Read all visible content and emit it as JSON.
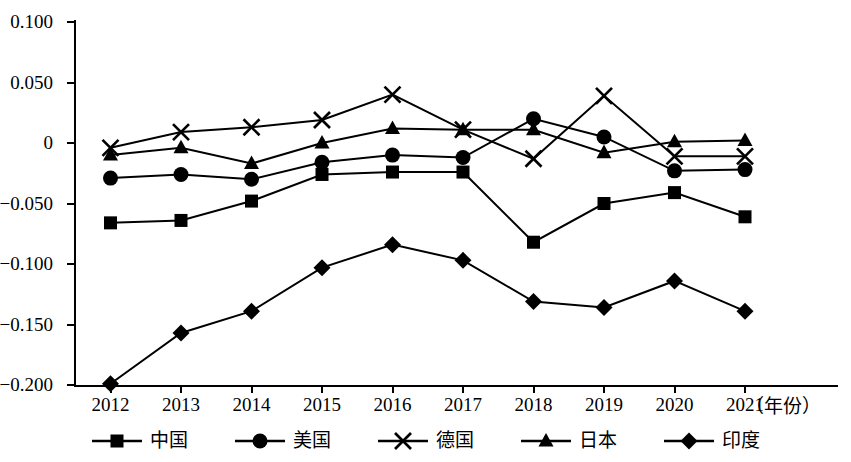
{
  "chart_data": {
    "type": "line",
    "title": "",
    "subtitle": "",
    "xlabel": "（年份）",
    "ylabel": "",
    "x": [
      2012,
      2013,
      2014,
      2015,
      2016,
      2017,
      2018,
      2019,
      2020,
      2021
    ],
    "categories": [
      "2012",
      "2013",
      "2014",
      "2015",
      "2016",
      "2017",
      "2018",
      "2019",
      "2020",
      "2021"
    ],
    "xlim": [
      2011.5,
      2021.6
    ],
    "ylim": [
      -0.2,
      0.1
    ],
    "yticks": [
      0.1,
      0.05,
      0,
      -0.05,
      -0.1,
      -0.15,
      -0.2
    ],
    "ytick_labels": [
      "0.100",
      "0.050",
      "0",
      "−0.050",
      "−0.100",
      "−0.150",
      "−0.200"
    ],
    "grid": false,
    "legend_position": "bottom",
    "series": [
      {
        "name": "中国",
        "marker": "square",
        "color": "#000000",
        "values": [
          -0.066,
          -0.064,
          -0.048,
          -0.026,
          -0.024,
          -0.024,
          -0.082,
          -0.05,
          -0.041,
          -0.061
        ]
      },
      {
        "name": "美国",
        "marker": "circle",
        "color": "#000000",
        "values": [
          -0.029,
          -0.026,
          -0.03,
          -0.016,
          -0.01,
          -0.012,
          0.02,
          0.005,
          -0.023,
          -0.022
        ]
      },
      {
        "name": "德国",
        "marker": "cross",
        "color": "#000000",
        "values": [
          -0.004,
          0.009,
          0.013,
          0.019,
          0.04,
          0.011,
          -0.013,
          0.039,
          -0.011,
          -0.011
        ]
      },
      {
        "name": "日本",
        "marker": "triangle",
        "color": "#000000",
        "values": [
          -0.01,
          -0.004,
          -0.017,
          0.0,
          0.012,
          0.011,
          0.011,
          -0.008,
          0.001,
          0.002
        ]
      },
      {
        "name": "印度",
        "marker": "diamond",
        "color": "#000000",
        "values": [
          -0.199,
          -0.157,
          -0.139,
          -0.103,
          -0.084,
          -0.097,
          -0.131,
          -0.136,
          -0.114,
          -0.139
        ]
      }
    ]
  },
  "legend": {
    "items": [
      {
        "label": "中国",
        "marker": "square"
      },
      {
        "label": "美国",
        "marker": "circle"
      },
      {
        "label": "德国",
        "marker": "cross"
      },
      {
        "label": "日本",
        "marker": "triangle"
      },
      {
        "label": "印度",
        "marker": "diamond"
      }
    ]
  }
}
